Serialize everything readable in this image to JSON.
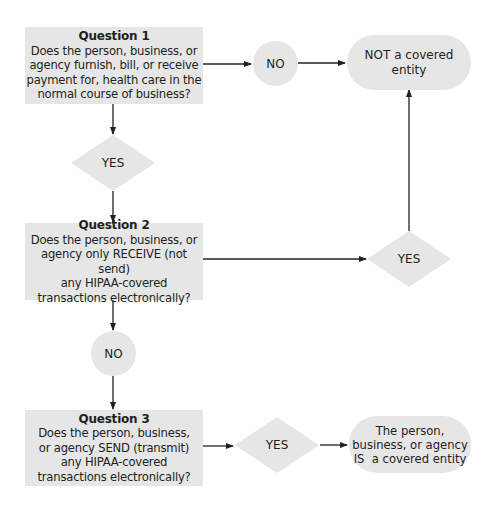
{
  "diagram": {
    "type": "flowchart",
    "colors": {
      "node_fill": "#e6e6e6",
      "edge": "#231f20",
      "text": "#231f20"
    },
    "question1": {
      "title": "Question 1",
      "lines": [
        "Does the person, business, or",
        "agency furnish, bill, or receive",
        "payment for, health care in the",
        "normal course of business?"
      ]
    },
    "no1": {
      "label": "NO"
    },
    "not_covered": {
      "lines": [
        "NOT a covered",
        "entity"
      ]
    },
    "yes1": {
      "label": "YES"
    },
    "question2": {
      "title": "Question 2",
      "lines": [
        "Does the person, business, or",
        "agency only RECEIVE (not send)",
        "any HIPAA-covered",
        "transactions electronically?"
      ]
    },
    "yes2": {
      "label": "YES"
    },
    "no2": {
      "label": "NO"
    },
    "question3": {
      "title": "Question 3",
      "lines": [
        "Does the person, business,",
        "or agency SEND (transmit)",
        "any HIPAA-covered",
        "transactions electronically?"
      ]
    },
    "yes3": {
      "label": "YES"
    },
    "is_covered": {
      "lines": [
        "The person,",
        "business, or agency",
        "IS  a covered entity"
      ]
    },
    "edges": [
      {
        "from": "question1",
        "to": "no1"
      },
      {
        "from": "no1",
        "to": "not_covered"
      },
      {
        "from": "question1",
        "to": "yes1"
      },
      {
        "from": "yes1",
        "to": "question2"
      },
      {
        "from": "question2",
        "to": "yes2"
      },
      {
        "from": "yes2",
        "to": "not_covered"
      },
      {
        "from": "question2",
        "to": "no2"
      },
      {
        "from": "no2",
        "to": "question3"
      },
      {
        "from": "question3",
        "to": "yes3"
      },
      {
        "from": "yes3",
        "to": "is_covered"
      }
    ]
  }
}
